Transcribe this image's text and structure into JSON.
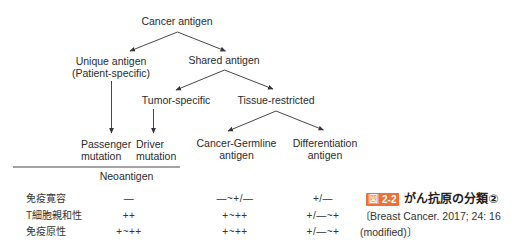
{
  "diagram": {
    "nodes": {
      "cancer_antigen": "Cancer antigen",
      "unique_antigen": {
        "line1": "Unique antigen",
        "line2": "(Patient-specific)"
      },
      "shared_antigen": "Shared antigen",
      "tumor_specific": "Tumor-specific",
      "tissue_restricted": "Tissue-restricted",
      "passenger_mutation": {
        "line1": "Passenger",
        "line2": "mutation"
      },
      "driver_mutation": {
        "line1": "Driver",
        "line2": "mutation"
      },
      "cancer_germline": {
        "line1": "Cancer-Germline",
        "line2": "antigen"
      },
      "differentiation": {
        "line1": "Differentiation",
        "line2": "antigen"
      },
      "neoantigen": "Neoantigen"
    },
    "edges": [
      {
        "from": "Cancer antigen",
        "to": "Unique antigen (Patient-specific)"
      },
      {
        "from": "Cancer antigen",
        "to": "Shared antigen"
      },
      {
        "from": "Shared antigen",
        "to": "Tumor-specific"
      },
      {
        "from": "Shared antigen",
        "to": "Tissue-restricted"
      },
      {
        "from": "Tissue-restricted",
        "to": "Cancer-Germline antigen"
      },
      {
        "from": "Tissue-restricted",
        "to": "Differentiation antigen"
      },
      {
        "from": "Unique antigen (Patient-specific)",
        "to": "Passenger mutation"
      },
      {
        "from": "Tumor-specific",
        "to": "Driver mutation"
      }
    ],
    "grouping": {
      "label": "Neoantigen",
      "members": [
        "Passenger mutation",
        "Driver mutation"
      ]
    }
  },
  "table": {
    "rows": [
      {
        "label": "免疫寛容",
        "values": [
          "—",
          "—~+/—",
          "+/—"
        ]
      },
      {
        "label": "T細胞親和性",
        "values": [
          "++",
          "+~++",
          "+/—~+"
        ]
      },
      {
        "label": "免疫原性",
        "values": [
          "+~++",
          "+~++",
          "+/—~+"
        ]
      }
    ]
  },
  "caption": {
    "badge_prefix": "図",
    "badge_number": "2-2",
    "title": "がん抗原の分類②",
    "source_line1": "〔Breast Cancer. 2017; 24: 16",
    "source_line2": "(modified)〕",
    "badge_color": "#ee6f36"
  }
}
